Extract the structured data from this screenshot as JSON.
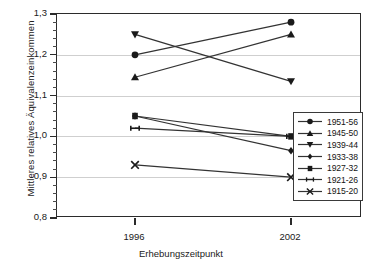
{
  "chart_data": {
    "type": "line",
    "title": "",
    "xlabel": "Erhebungszeitpunkt",
    "ylabel": "Mittleres relatives Äquivalenzeinkommen",
    "x": [
      "1996",
      "2002"
    ],
    "xtick_labels": [
      "1996",
      "2002"
    ],
    "ytick_labels": [
      "1,3",
      "1,2",
      "1,1",
      "1,0",
      "0,9",
      "0,8"
    ],
    "ytick_values": [
      1.3,
      1.2,
      1.1,
      1.0,
      0.9,
      0.8
    ],
    "ylim": [
      0.8,
      1.3
    ],
    "y_minor_step": 0.02,
    "grid": "horizontal",
    "legend_position": "bottom-right",
    "line_color": "#333333",
    "marker_color": "#1a1a1a",
    "grid_color": "#cfcfcf",
    "series": [
      {
        "name": "1951-56",
        "marker": "circle",
        "values": [
          1.2,
          1.28
        ]
      },
      {
        "name": "1945-50",
        "marker": "triangle-up",
        "values": [
          1.145,
          1.25
        ]
      },
      {
        "name": "1939-44",
        "marker": "triangle-down",
        "values": [
          1.25,
          1.135
        ]
      },
      {
        "name": "1933-38",
        "marker": "diamond",
        "values": [
          1.05,
          0.965
        ]
      },
      {
        "name": "1927-32",
        "marker": "square",
        "values": [
          1.05,
          1.0
        ]
      },
      {
        "name": "1921-26",
        "marker": "hbar",
        "values": [
          1.02,
          1.0
        ]
      },
      {
        "name": "1915-20",
        "marker": "cross-x",
        "values": [
          0.93,
          0.9
        ]
      }
    ]
  },
  "legend": {
    "items": [
      {
        "label": "1951-56"
      },
      {
        "label": "1945-50"
      },
      {
        "label": "1939-44"
      },
      {
        "label": "1933-38"
      },
      {
        "label": "1927-32"
      },
      {
        "label": "1921-26"
      },
      {
        "label": "1915-20"
      }
    ]
  }
}
